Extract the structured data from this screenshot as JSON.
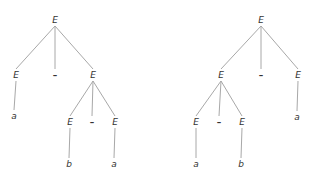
{
  "diagram": {
    "type": "parse-trees",
    "colors": {
      "edge": "#a8a8a8",
      "text": "#333333",
      "background": "#ffffff"
    },
    "trees": [
      {
        "name": "left-tree",
        "nodes": [
          {
            "id": "L0",
            "label": "E",
            "x": 55,
            "y": 20
          },
          {
            "id": "L1",
            "label": "E",
            "x": 16,
            "y": 75
          },
          {
            "id": "L2",
            "label": "–",
            "x": 55,
            "y": 75
          },
          {
            "id": "L3",
            "label": "E",
            "x": 93,
            "y": 75
          },
          {
            "id": "L4",
            "label": "a",
            "x": 14,
            "y": 116
          },
          {
            "id": "L5",
            "label": "E",
            "x": 70,
            "y": 122
          },
          {
            "id": "L6",
            "label": "–",
            "x": 92,
            "y": 122
          },
          {
            "id": "L7",
            "label": "E",
            "x": 115,
            "y": 122
          },
          {
            "id": "L8",
            "label": "b",
            "x": 69,
            "y": 164
          },
          {
            "id": "L9",
            "label": "a",
            "x": 114,
            "y": 164
          }
        ],
        "edges": [
          [
            "L0",
            "L1"
          ],
          [
            "L0",
            "L2"
          ],
          [
            "L0",
            "L3"
          ],
          [
            "L1",
            "L4"
          ],
          [
            "L3",
            "L5"
          ],
          [
            "L3",
            "L6"
          ],
          [
            "L3",
            "L7"
          ],
          [
            "L5",
            "L8"
          ],
          [
            "L7",
            "L9"
          ]
        ]
      },
      {
        "name": "right-tree",
        "nodes": [
          {
            "id": "R0",
            "label": "E",
            "x": 261,
            "y": 20
          },
          {
            "id": "R1",
            "label": "E",
            "x": 221,
            "y": 75
          },
          {
            "id": "R2",
            "label": "–",
            "x": 261,
            "y": 75
          },
          {
            "id": "R3",
            "label": "E",
            "x": 298,
            "y": 75
          },
          {
            "id": "R4",
            "label": "a",
            "x": 297,
            "y": 117
          },
          {
            "id": "R5",
            "label": "E",
            "x": 196,
            "y": 122
          },
          {
            "id": "R6",
            "label": "–",
            "x": 219,
            "y": 122
          },
          {
            "id": "R7",
            "label": "E",
            "x": 242,
            "y": 122
          },
          {
            "id": "R8",
            "label": "a",
            "x": 196,
            "y": 164
          },
          {
            "id": "R9",
            "label": "b",
            "x": 241,
            "y": 164
          }
        ],
        "edges": [
          [
            "R0",
            "R1"
          ],
          [
            "R0",
            "R2"
          ],
          [
            "R0",
            "R3"
          ],
          [
            "R3",
            "R4"
          ],
          [
            "R1",
            "R5"
          ],
          [
            "R1",
            "R6"
          ],
          [
            "R1",
            "R7"
          ],
          [
            "R5",
            "R8"
          ],
          [
            "R7",
            "R9"
          ]
        ]
      }
    ]
  }
}
